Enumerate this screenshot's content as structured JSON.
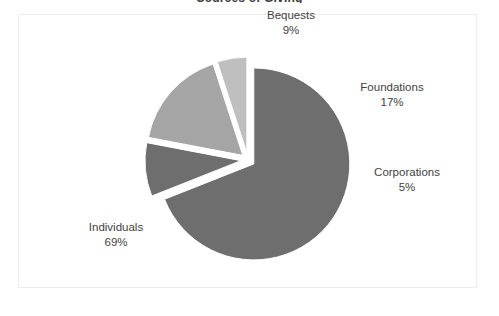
{
  "chart_title": "Sources of Giving",
  "frame": {
    "border_color": "#ededed",
    "background": "#ffffff"
  },
  "chart_data": {
    "type": "pie",
    "title": "Sources of Giving",
    "subtitle": "",
    "xlabel": "",
    "ylabel": "",
    "legend_position": "none",
    "labels_shown": "category-and-percent",
    "exploded": true,
    "start_angle_deg": -90,
    "direction": "clockwise",
    "categories": [
      "Individuals",
      "Bequests",
      "Foundations",
      "Corporations"
    ],
    "values": [
      69,
      17,
      9,
      5
    ],
    "units": "percent",
    "total": 100,
    "slices": [
      {
        "name": "Individuals",
        "value": 69,
        "percent_label": "69%",
        "color": "#6e6e6e",
        "label_position": "lower-left",
        "exploded": true
      },
      {
        "name": "Bequests",
        "value": 9,
        "percent_label": "9%",
        "color": "#6e6e6e",
        "label_position": "top",
        "exploded": true
      },
      {
        "name": "Foundations",
        "value": 17,
        "percent_label": "17%",
        "color": "#a5a5a5",
        "label_position": "right-upper",
        "exploded": true
      },
      {
        "name": "Corporations",
        "value": 5,
        "percent_label": "5%",
        "color": "#bfbfbf",
        "label_position": "right-lower",
        "exploded": true
      }
    ]
  },
  "labels": {
    "bequests": {
      "name": "Bequests",
      "percent": "9%"
    },
    "foundations": {
      "name": "Foundations",
      "percent": "17%"
    },
    "corporations": {
      "name": "Corporations",
      "percent": "5%"
    },
    "individuals": {
      "name": "Individuals",
      "percent": "69%"
    }
  },
  "colors": {
    "individuals": "#6e6e6e",
    "bequests": "#6e6e6e",
    "foundations": "#a5a5a5",
    "corporations": "#bfbfbf",
    "label_text": "#3f3f3f",
    "title_text": "#3a3a3a",
    "frame_border": "#ededed",
    "gap": "#ffffff"
  }
}
